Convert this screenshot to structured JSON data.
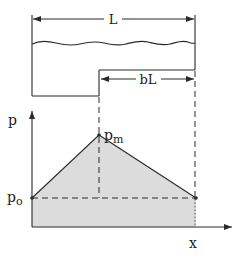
{
  "diagram": {
    "type": "hydraulic step / pressure distribution schematic",
    "colors": {
      "stroke": "#2a2a2a",
      "fill_shade": "#dcdcdc",
      "background": "#ffffff"
    },
    "labels": {
      "total_length": "L",
      "step_length": "bL",
      "pressure_axis": "p",
      "max_pressure": "p",
      "max_pressure_sub": "m",
      "base_pressure": "p",
      "base_pressure_sub": "o",
      "position_axis": "x"
    },
    "profile": {
      "points": [
        {
          "name": "p_o",
          "x": 0,
          "p": "p_o"
        },
        {
          "name": "p_m",
          "x": "(1-b)L",
          "p": "p_m"
        },
        {
          "name": "end",
          "x": "L",
          "p": "p_o"
        }
      ]
    }
  }
}
